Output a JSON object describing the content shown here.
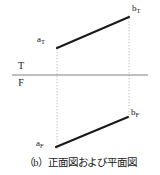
{
  "figure": {
    "caption": "（b）正面図および平面図",
    "background_color": "#ffffff",
    "ink_color": "#1a1a1a",
    "ground_line_color": "#808080",
    "projector_color": "#b9b9b9",
    "reference_line": {
      "name": "TF ground line",
      "upper_label": "T",
      "lower_label": "F",
      "x1": 12,
      "x2": 148,
      "y": 75
    },
    "points": [
      {
        "id": "a_T",
        "base": "a",
        "sub": "T",
        "x": 57,
        "y": 48,
        "label_x": 37,
        "label_y": 35
      },
      {
        "id": "b_T",
        "base": "b",
        "sub": "T",
        "x": 129,
        "y": 17,
        "label_x": 132,
        "label_y": 4
      },
      {
        "id": "a_F",
        "base": "a",
        "sub": "F",
        "x": 56,
        "y": 147,
        "label_x": 36,
        "label_y": 139
      },
      {
        "id": "b_F",
        "base": "b",
        "sub": "F",
        "x": 128,
        "y": 117,
        "label_x": 131,
        "label_y": 108
      }
    ],
    "segments": [
      {
        "id": "top-view-line",
        "from": "a_T",
        "to": "b_T",
        "x1": 57,
        "y1": 48,
        "x2": 129,
        "y2": 17
      },
      {
        "id": "front-view-line",
        "from": "a_F",
        "to": "b_F",
        "x1": 56,
        "y1": 147,
        "x2": 128,
        "y2": 117
      }
    ],
    "projectors": [
      {
        "id": "projector-a",
        "x": 57,
        "y1": 46,
        "y2": 149
      },
      {
        "id": "projector-b",
        "x": 129,
        "y1": 15,
        "y2": 119
      }
    ]
  }
}
